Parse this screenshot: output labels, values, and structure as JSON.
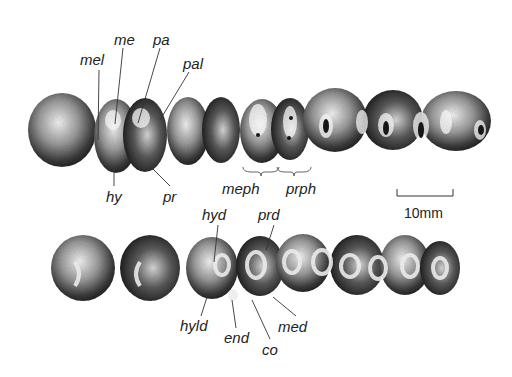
{
  "figure": {
    "upper_row": {
      "description": "upper molar/premolar tooth row (occlusal view)",
      "tooth_count": 10,
      "labels": [
        {
          "id": "mel",
          "text": "mel",
          "x": 80,
          "y": 52
        },
        {
          "id": "me",
          "text": "me",
          "x": 114,
          "y": 32
        },
        {
          "id": "pa",
          "text": "pa",
          "x": 153,
          "y": 32
        },
        {
          "id": "pal",
          "text": "pal",
          "x": 183,
          "y": 56
        },
        {
          "id": "hy",
          "text": "hy",
          "x": 106,
          "y": 189
        },
        {
          "id": "pr",
          "text": "pr",
          "x": 163,
          "y": 189
        },
        {
          "id": "meph",
          "text": "meph",
          "x": 222,
          "y": 181
        },
        {
          "id": "prph",
          "text": "prph",
          "x": 286,
          "y": 181
        }
      ]
    },
    "lower_row": {
      "description": "lower tooth row (occlusal view)",
      "tooth_count": 8,
      "labels": [
        {
          "id": "hyd",
          "text": "hyd",
          "x": 202,
          "y": 207
        },
        {
          "id": "prd",
          "text": "prd",
          "x": 258,
          "y": 207
        },
        {
          "id": "hyld",
          "text": "hyld",
          "x": 180,
          "y": 318
        },
        {
          "id": "end",
          "text": "end",
          "x": 224,
          "y": 330
        },
        {
          "id": "co",
          "text": "co",
          "x": 262,
          "y": 342
        },
        {
          "id": "med",
          "text": "med",
          "x": 278,
          "y": 319
        }
      ]
    },
    "scale_bar": {
      "label": "10mm",
      "x1": 397,
      "x2": 453,
      "y": 194
    }
  }
}
